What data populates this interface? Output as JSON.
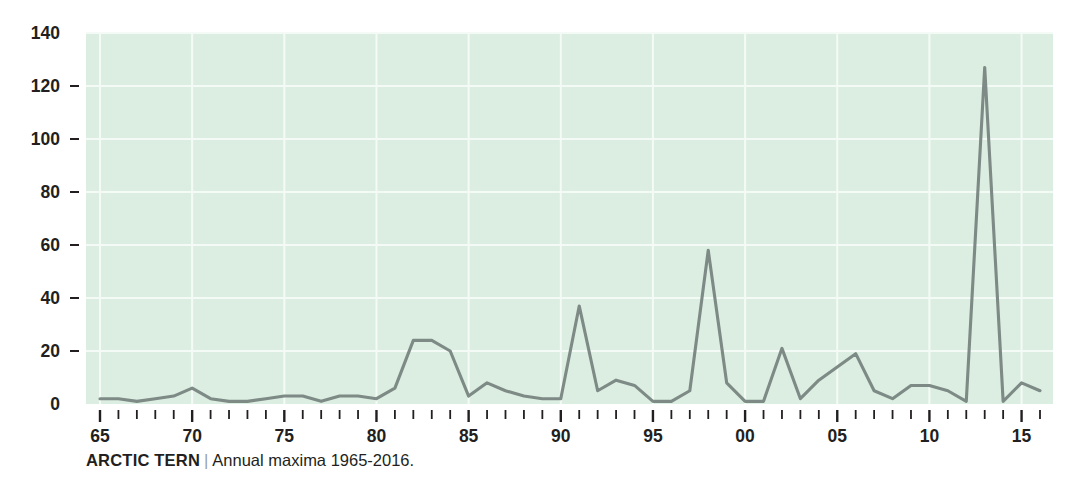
{
  "caption": {
    "title": "ARCTIC TERN",
    "separator": "|",
    "subtitle": "Annual maxima 1965-2016."
  },
  "colors": {
    "plot_background": "#dceee1",
    "gridline": "#f4fbf6",
    "line": "#7d8a86",
    "text": "#231f20",
    "separator": "#9aa0a6",
    "page_background": "#ffffff"
  },
  "chart_data": {
    "type": "line",
    "title": "ARCTIC TERN",
    "subtitle": "Annual maxima 1965-2016.",
    "xlabel": "",
    "ylabel": "",
    "xlim": [
      1965,
      2016
    ],
    "ylim": [
      0,
      140
    ],
    "grid": true,
    "legend": false,
    "y_ticks": [
      0,
      20,
      40,
      60,
      80,
      100,
      120,
      140
    ],
    "y_tick_labels": [
      "0",
      "20",
      "40",
      "60",
      "80",
      "100",
      "120",
      "140"
    ],
    "x_ticks": [
      1965,
      1970,
      1975,
      1980,
      1985,
      1990,
      1995,
      2000,
      2005,
      2010,
      2015
    ],
    "x_tick_labels": [
      "65",
      "70",
      "75",
      "80",
      "85",
      "90",
      "95",
      "00",
      "05",
      "10",
      "15"
    ],
    "x_minor_ticks_every": 1,
    "series": [
      {
        "name": "Annual maxima",
        "x": [
          1965,
          1966,
          1967,
          1968,
          1969,
          1970,
          1971,
          1972,
          1973,
          1974,
          1975,
          1976,
          1977,
          1978,
          1979,
          1980,
          1981,
          1982,
          1983,
          1984,
          1985,
          1986,
          1987,
          1988,
          1989,
          1990,
          1991,
          1992,
          1993,
          1994,
          1995,
          1996,
          1997,
          1998,
          1999,
          2000,
          2001,
          2002,
          2003,
          2004,
          2005,
          2006,
          2007,
          2008,
          2009,
          2010,
          2011,
          2012,
          2013,
          2014,
          2015,
          2016
        ],
        "values": [
          2,
          2,
          1,
          2,
          3,
          6,
          2,
          1,
          1,
          2,
          3,
          3,
          1,
          3,
          3,
          2,
          6,
          24,
          24,
          20,
          3,
          8,
          5,
          3,
          2,
          2,
          37,
          5,
          9,
          7,
          1,
          1,
          5,
          58,
          8,
          1,
          1,
          21,
          2,
          9,
          14,
          19,
          5,
          2,
          7,
          7,
          5,
          1,
          127,
          1,
          8,
          5
        ]
      }
    ]
  }
}
